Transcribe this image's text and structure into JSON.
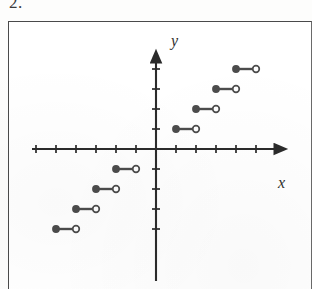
{
  "problem": {
    "number_label": "2."
  },
  "figure": {
    "x_axis_label": "x",
    "y_axis_label": "y"
  },
  "chart_data": {
    "type": "line",
    "title": "",
    "subtitle": "",
    "xlabel": "x",
    "ylabel": "y",
    "xlim": [
      -6.2,
      6.2
    ],
    "ylim": [
      -4.8,
      4.8
    ],
    "grid": false,
    "legend": null,
    "axis_style": {
      "arrow_heads": [
        "x-positive",
        "y-positive"
      ],
      "tick_spacing": 1,
      "tick_length_px": 8,
      "x_ticks": [
        -6,
        -5,
        -4,
        -3,
        -2,
        -1,
        1,
        2,
        3,
        4,
        5,
        6
      ],
      "y_ticks": [
        -4,
        -3,
        -2,
        -1,
        1,
        2,
        3,
        4
      ],
      "tick_labels_shown": false,
      "axis_color": "#2b2b2b"
    },
    "marker_style": {
      "left_endpoint": "filled-dot",
      "right_endpoint": "open-circle",
      "segment_color": "#4c4c4c",
      "dot_color": "#4c4c4c"
    },
    "segments": [
      {
        "x_start": -5,
        "x_end": -4,
        "y": -4,
        "left_closed": true,
        "right_closed": false
      },
      {
        "x_start": -4,
        "x_end": -3,
        "y": -3,
        "left_closed": true,
        "right_closed": false
      },
      {
        "x_start": -3,
        "x_end": -2,
        "y": -2,
        "left_closed": true,
        "right_closed": false
      },
      {
        "x_start": -2,
        "x_end": -1,
        "y": -1,
        "left_closed": true,
        "right_closed": false
      },
      {
        "x_start": 1,
        "x_end": 2,
        "y": 1,
        "left_closed": true,
        "right_closed": false
      },
      {
        "x_start": 2,
        "x_end": 3,
        "y": 2,
        "left_closed": true,
        "right_closed": false
      },
      {
        "x_start": 3,
        "x_end": 4,
        "y": 3,
        "left_closed": true,
        "right_closed": false
      },
      {
        "x_start": 4,
        "x_end": 5,
        "y": 4,
        "left_closed": true,
        "right_closed": false
      }
    ]
  }
}
